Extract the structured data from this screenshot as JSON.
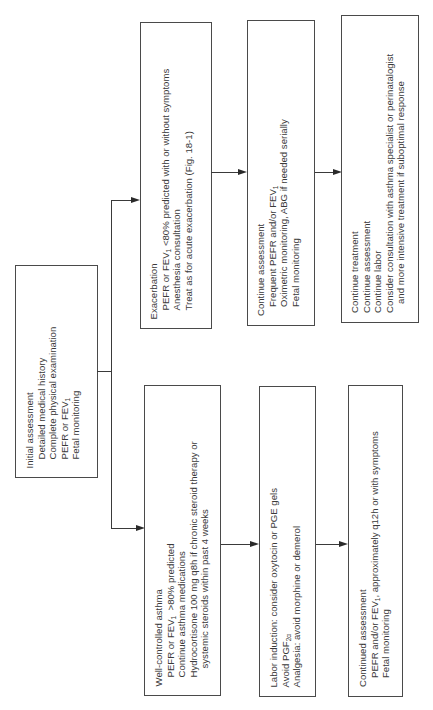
{
  "diagram": {
    "initial": {
      "title": "Initial assessment",
      "items": [
        "Detailed medical history",
        "Complete physical examination",
        "PEFR or FEV",
        "Fetal monitoring"
      ],
      "subscript_on_item_3": "1"
    },
    "exacerbation": {
      "title": "Exacerbation",
      "items": [
        "PEFR or FEV",
        "<80% predicted with or without symptoms",
        "Anesthesia consultation",
        "Treat as for acute exacerbation (Fig. 18-1)"
      ],
      "sub": "1"
    },
    "continue_assessment": {
      "title": "Continue assessment",
      "items": [
        "Frequent PEFR and/or FEV",
        "Oximetric monitoring, ABG if needed serially",
        "Fetal monitoring"
      ],
      "sub": "1"
    },
    "continue_treatment": {
      "items": [
        "Continue treatment",
        "Continue assessment",
        "Continue labor",
        "Consider consultation with asthma specialist or perinatalogist",
        "and more intensive treatment if suboptimal response"
      ]
    },
    "well_controlled": {
      "title": "Well-controlled asthma",
      "items": [
        "PEFR or FEV",
        "  >80% predicted",
        "Continue asthma medications",
        "Hydrocortisone 100 mg q8h if chronic steroid therapy or",
        "systemic steroids within past 4 weeks"
      ],
      "sub": "1"
    },
    "labor_induction": {
      "items": [
        "Labor induction: consider oxytocin or PGE gels",
        "Avoid PGF",
        "Analgesia: avoid morphine or demerol"
      ],
      "sub": "2α"
    },
    "continued_assessment": {
      "title": "Continued assessment",
      "items": [
        "PEFR and/or FEV",
        " approximately q12h or with symptoms",
        "Fetal monitoring"
      ],
      "sub": "1",
      "sep": ","
    }
  }
}
